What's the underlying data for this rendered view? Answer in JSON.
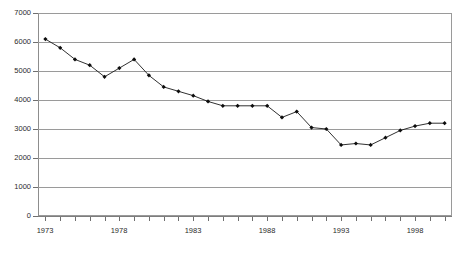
{
  "chart_data": {
    "type": "line",
    "title": "",
    "subtitle": "",
    "xlabel": "",
    "ylabel": "",
    "xlim": [
      1972.5,
      2000.5
    ],
    "ylim": [
      0,
      7000
    ],
    "grid": "horizontal",
    "legend": "none",
    "marker": "filled-diamond",
    "line_color": "#1a1a1a",
    "gridline_color": "#9a9a9a",
    "y_ticks": [
      0,
      1000,
      2000,
      3000,
      4000,
      5000,
      6000,
      7000
    ],
    "y_tick_labels": [
      "0",
      "1000",
      "2000",
      "3000",
      "4000",
      "5000",
      "6000",
      "7000"
    ],
    "x_tick_labels": [
      "1973",
      "1978",
      "1983",
      "1988",
      "1993",
      "1998"
    ],
    "x_tick_label_years": [
      1973,
      1978,
      1983,
      1988,
      1993,
      1998
    ],
    "x_all_tick_years": [
      1973,
      1974,
      1975,
      1976,
      1977,
      1978,
      1979,
      1980,
      1981,
      1982,
      1983,
      1984,
      1985,
      1986,
      1987,
      1988,
      1989,
      1990,
      1991,
      1992,
      1993,
      1994,
      1995,
      1996,
      1997,
      1998,
      1999,
      2000
    ],
    "categories": [
      1973,
      1974,
      1975,
      1976,
      1977,
      1978,
      1979,
      1980,
      1981,
      1982,
      1983,
      1984,
      1985,
      1986,
      1987,
      1988,
      1989,
      1990,
      1991,
      1992,
      1993,
      1994,
      1995,
      1996,
      1997,
      1998,
      1999,
      2000
    ],
    "values": [
      6100,
      5800,
      5400,
      5200,
      4800,
      5100,
      5400,
      4850,
      4450,
      4300,
      4150,
      3950,
      3800,
      3800,
      3800,
      3800,
      3400,
      3600,
      3050,
      3000,
      2450,
      2500,
      2450,
      2700,
      2950,
      3100,
      3200,
      3200
    ],
    "series": [
      {
        "name": "series-1",
        "values": [
          6100,
          5800,
          5400,
          5200,
          4800,
          5100,
          5400,
          4850,
          4450,
          4300,
          4150,
          3950,
          3800,
          3800,
          3800,
          3800,
          3400,
          3600,
          3050,
          3000,
          2450,
          2500,
          2450,
          2700,
          2950,
          3100,
          3200,
          3200
        ]
      }
    ]
  }
}
